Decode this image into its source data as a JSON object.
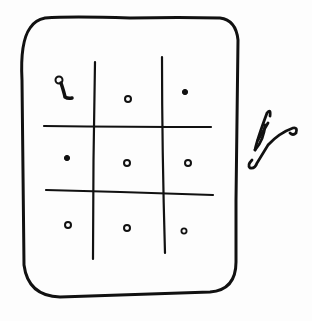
{
  "diagram": {
    "type": "hand-drawn sketch",
    "stroke_color": "#111111",
    "background_color": "#fdfdfd",
    "grid": {
      "rows": 3,
      "cols": 3,
      "cells": [
        [
          "glyph-1",
          "dot",
          "dot"
        ],
        [
          "dot",
          "dot",
          "dot"
        ],
        [
          "dot",
          "dot",
          "dot"
        ]
      ]
    },
    "side_mark": "squiggle"
  }
}
